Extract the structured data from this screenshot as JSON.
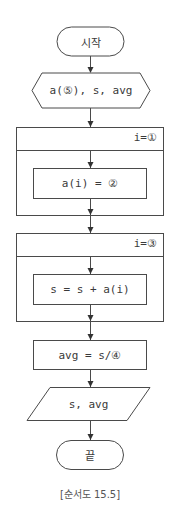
{
  "flowchart": {
    "start": {
      "label": "시작"
    },
    "declare": {
      "label": "a(⑤), s, avg"
    },
    "loop1": {
      "header": "i=①",
      "body": "a(i) = ②"
    },
    "loop2": {
      "header": "i=③",
      "body": "s = s + a(i)"
    },
    "compute": {
      "label": "avg = s/④"
    },
    "output": {
      "label": "s, avg"
    },
    "end": {
      "label": "끝"
    }
  },
  "caption": "[순서도 15.5]",
  "colors": {
    "stroke": "#4a4a4a",
    "text": "#3a3a3a",
    "background": "#ffffff"
  }
}
